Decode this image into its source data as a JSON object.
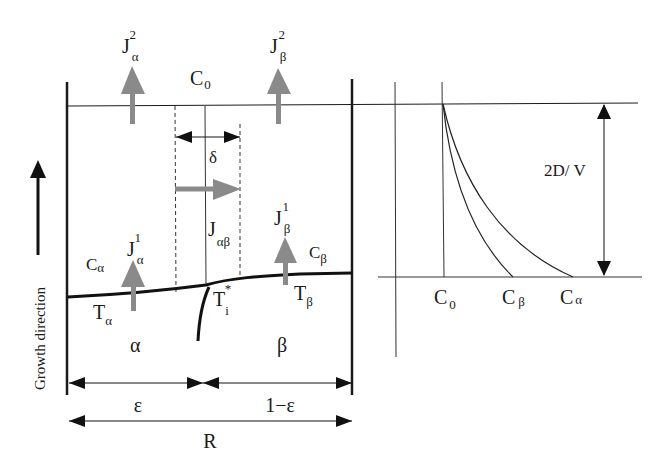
{
  "diagram": {
    "title": "",
    "left_panel": {
      "top_concentration": {
        "main": "C",
        "sub": "0"
      },
      "flux_alpha_top": {
        "main": "J",
        "sub": "α",
        "sup": "2"
      },
      "flux_beta_top": {
        "main": "J",
        "sub": "β",
        "sup": "2"
      },
      "flux_alpha_bottom": {
        "main": "J",
        "sub": "α",
        "sup": "1"
      },
      "flux_beta_bottom": {
        "main": "J",
        "sub": "β",
        "sup": "1"
      },
      "lateral_flux": {
        "main": "J",
        "sub": "αβ"
      },
      "delta": "δ",
      "conc_alpha": {
        "main": "C",
        "sub": "α"
      },
      "conc_beta": {
        "main": "C",
        "sub": "β"
      },
      "temp_alpha": {
        "main": "T",
        "sub": "α"
      },
      "temp_beta": {
        "main": "T",
        "sub": "β"
      },
      "temp_interface": {
        "main": "T",
        "sub": "i",
        "sup": "*"
      },
      "phase_alpha": "α",
      "phase_beta": "β",
      "width_alpha": "ε",
      "width_beta": "1−ε",
      "total_width": "R",
      "growth_direction": "Growth direction"
    },
    "right_panel": {
      "length_scale": "2D/ V",
      "x_labels": [
        {
          "main": "C",
          "sub": "0"
        },
        {
          "main": "C",
          "sub": "β"
        },
        {
          "main": "C",
          "sub": "α"
        }
      ]
    },
    "colors": {
      "line": "#1a1a1a",
      "flux_arrow": "#8a8a8a"
    }
  }
}
